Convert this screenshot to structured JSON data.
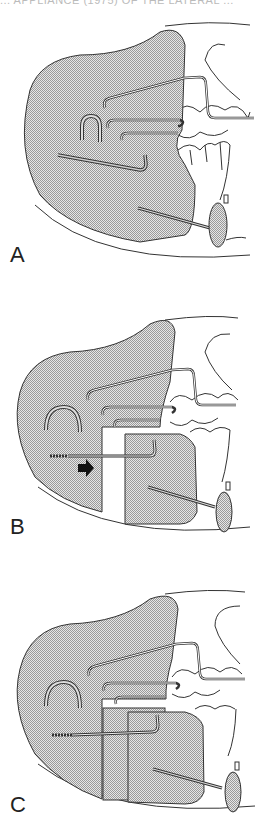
{
  "figure": {
    "top_caption": "... APPLIANCE (1975) OF THE LATERAL ...",
    "colors": {
      "stipple_fill": "#bdbdbd",
      "line": "#333333",
      "background": "#ffffff",
      "arrow": "#111111"
    },
    "panels": [
      {
        "label": "A",
        "description": "Appliance with single acrylic shield, wire springs and labial bow, lower lip pad"
      },
      {
        "label": "B",
        "description": "Shield sectioned with lower segment separated; arrow indicates forward advancement"
      },
      {
        "label": "C",
        "description": "Lower segment repositioned overlapping the upper shield"
      }
    ]
  }
}
